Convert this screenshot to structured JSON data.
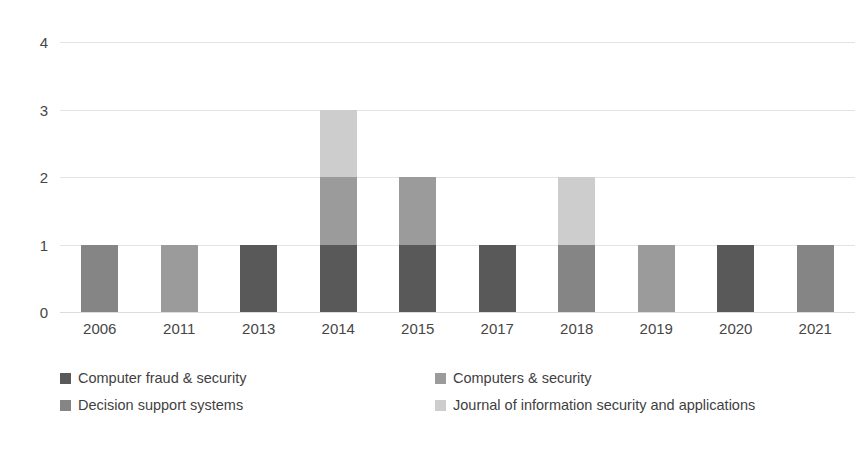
{
  "chart_data": {
    "type": "bar",
    "stacked": true,
    "title": "",
    "xlabel": "",
    "ylabel": "",
    "categories": [
      "2006",
      "2011",
      "2013",
      "2014",
      "2015",
      "2017",
      "2018",
      "2019",
      "2020",
      "2021"
    ],
    "ylim": [
      0,
      4
    ],
    "yticks": [
      "0",
      "1",
      "2",
      "3",
      "4"
    ],
    "grid": true,
    "legend_position": "bottom",
    "series": [
      {
        "name": "Computer fraud & security",
        "color": "#595959",
        "values": [
          0,
          0,
          1,
          1,
          1,
          1,
          0,
          0,
          1,
          0
        ]
      },
      {
        "name": "Computers & security",
        "color": "#9b9b9b",
        "values": [
          0,
          1,
          0,
          1,
          1,
          0,
          0,
          1,
          0,
          0
        ]
      },
      {
        "name": "Decision support systems",
        "color": "#858585",
        "values": [
          1,
          0,
          0,
          0,
          0,
          0,
          1,
          0,
          0,
          1
        ]
      },
      {
        "name": "Journal of information security and applications",
        "color": "#cdcdcd",
        "values": [
          0,
          0,
          0,
          1,
          0,
          0,
          1,
          0,
          0,
          0
        ]
      }
    ],
    "totals": [
      1,
      1,
      1,
      3,
      2,
      1,
      2,
      1,
      1,
      1
    ]
  },
  "axis": {
    "y_tick_labels": [
      "4",
      "3",
      "2",
      "1",
      "0"
    ],
    "x_tick_labels": [
      "2006",
      "2011",
      "2013",
      "2014",
      "2015",
      "2017",
      "2018",
      "2019",
      "2020",
      "2021"
    ]
  },
  "legend": {
    "rows": [
      [
        {
          "label": "Computer fraud & security",
          "color": "#595959"
        },
        {
          "label": "Computers & security",
          "color": "#9b9b9b"
        }
      ],
      [
        {
          "label": "Decision support systems",
          "color": "#858585"
        },
        {
          "label": "Journal of information security and applications",
          "color": "#cdcdcd"
        }
      ]
    ]
  },
  "colors": {
    "grid": "#e4e4e4",
    "text": "#464646",
    "background": "#ffffff"
  }
}
